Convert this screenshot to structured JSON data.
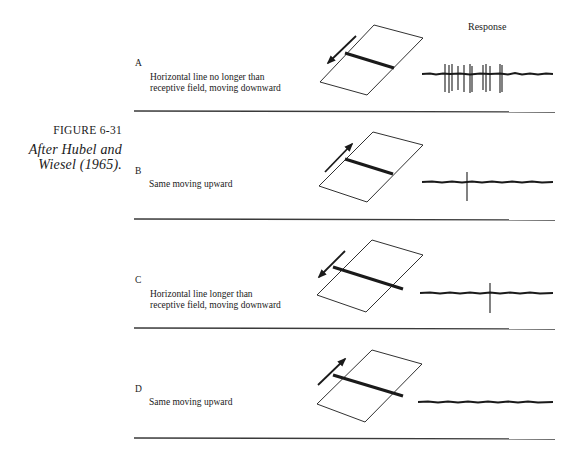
{
  "figure": {
    "label": "FIGURE 6-31",
    "credit_line1": "After Hubel and",
    "credit_line2": "Wiesel (1965).",
    "response_header": "Response"
  },
  "panels": [
    {
      "letter": "A",
      "line1": "Horizontal line no longer than",
      "line2": "receptive field, moving downward",
      "stimulus": "line-within-receptive-field",
      "motion": "downward",
      "spike_count": 12
    },
    {
      "letter": "B",
      "line1": "Same moving upward",
      "line2": "",
      "stimulus": "line-within-receptive-field",
      "motion": "upward",
      "spike_count": 1
    },
    {
      "letter": "C",
      "line1": "Horizontal line longer than",
      "line2": "receptive field, moving downward",
      "stimulus": "line-extends-beyond-receptive-field",
      "motion": "downward",
      "spike_count": 1
    },
    {
      "letter": "D",
      "line1": "Same moving upward",
      "line2": "",
      "stimulus": "line-extends-beyond-receptive-field",
      "motion": "upward",
      "spike_count": 0
    }
  ],
  "colors": {
    "ink": "#1a1a1a",
    "divider": "#3a3a3a",
    "background": "#ffffff"
  }
}
